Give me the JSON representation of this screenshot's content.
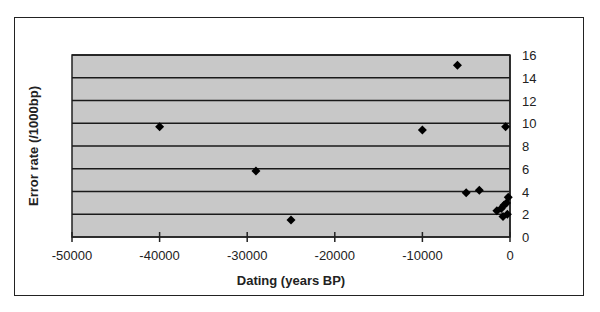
{
  "chart_data": {
    "type": "scatter",
    "title": "",
    "xlabel": "Dating (years BP)",
    "ylabel": "Error rate (/1000bp)",
    "xlim": [
      -50000,
      0
    ],
    "ylim": [
      0,
      16
    ],
    "x_ticks": [
      -50000,
      -40000,
      -30000,
      -20000,
      -10000,
      0
    ],
    "y_ticks": [
      0,
      2,
      4,
      6,
      8,
      10,
      12,
      14,
      16
    ],
    "y_axis_position": "right",
    "grid": {
      "horizontal": true,
      "vertical": false
    },
    "legend": null,
    "plot_background": "#c8c8c8",
    "marker": "diamond",
    "marker_color": "#000000",
    "series": [
      {
        "name": "Error rate",
        "points": [
          {
            "x": -40000,
            "y": 9.7
          },
          {
            "x": -29000,
            "y": 5.8
          },
          {
            "x": -25000,
            "y": 1.5
          },
          {
            "x": -10000,
            "y": 9.4
          },
          {
            "x": -6000,
            "y": 15.1
          },
          {
            "x": -500,
            "y": 9.7
          },
          {
            "x": -5000,
            "y": 3.9
          },
          {
            "x": -3500,
            "y": 4.1
          },
          {
            "x": -200,
            "y": 3.5
          },
          {
            "x": -1500,
            "y": 2.3
          },
          {
            "x": -1000,
            "y": 2.5
          },
          {
            "x": -700,
            "y": 2.8
          },
          {
            "x": -400,
            "y": 3.0
          },
          {
            "x": -800,
            "y": 1.8
          },
          {
            "x": -300,
            "y": 2.0
          }
        ]
      }
    ]
  },
  "labels": {
    "xlabel": "Dating (years BP)",
    "ylabel": "Error rate (/1000bp)"
  }
}
